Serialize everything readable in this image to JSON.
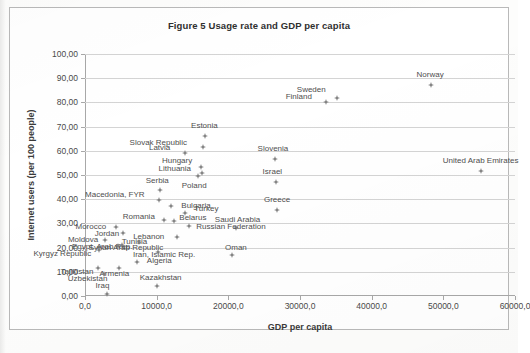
{
  "chart_data": {
    "type": "scatter",
    "title": "Figure 5 Usage rate and GDP per capita",
    "xlabel": "GDP per capita",
    "ylabel": "Internet users (per 100 people)",
    "xlim": [
      0,
      60000
    ],
    "ylim": [
      0,
      100
    ],
    "xticks": [
      0,
      10000,
      20000,
      30000,
      40000,
      50000,
      60000
    ],
    "yticks": [
      0,
      10,
      20,
      30,
      40,
      50,
      60,
      70,
      80,
      90,
      100
    ],
    "xtick_labels": [
      "0,0",
      "10000,0",
      "20000,0",
      "30000,0",
      "40000,0",
      "50000,0",
      "60000,0"
    ],
    "ytick_labels": [
      "0,00",
      "10,00",
      "20,00",
      "30,00",
      "40,00",
      "50,00",
      "60,00",
      "70,00",
      "80,00",
      "90,00",
      "100,00"
    ],
    "grid": true,
    "legend": false,
    "marker_color": "#7d7d7d",
    "points": [
      {
        "label": "Norway",
        "x": 48300,
        "y": 87.0,
        "lx": -1,
        "ly": -11
      },
      {
        "label": "Sweden",
        "x": 35200,
        "y": 82.0,
        "lx": -26,
        "ly": -9
      },
      {
        "label": "Finland",
        "x": 33600,
        "y": 80.0,
        "lx": -27,
        "ly": -6
      },
      {
        "label": "Estonia",
        "x": 16800,
        "y": 66.0,
        "lx": -1,
        "ly": -11
      },
      {
        "label": "Slovak Republic",
        "x": 16500,
        "y": 61.5,
        "lx": -45,
        "ly": -5
      },
      {
        "label": "Latvia",
        "x": 13900,
        "y": 59.0,
        "lx": -25,
        "ly": -6
      },
      {
        "label": "Hungary",
        "x": 16200,
        "y": 53.5,
        "lx": -24,
        "ly": -7
      },
      {
        "label": "Lithuania",
        "x": 16300,
        "y": 51.0,
        "lx": -27,
        "ly": -5
      },
      {
        "label": "Poland",
        "x": 15800,
        "y": 49.5,
        "lx": -4,
        "ly": 9
      },
      {
        "label": "Serbia",
        "x": 10500,
        "y": 44.0,
        "lx": -3,
        "ly": -10
      },
      {
        "label": "Slovenia",
        "x": 26500,
        "y": 56.5,
        "lx": -2,
        "ly": -11
      },
      {
        "label": "Israel",
        "x": 26700,
        "y": 47.0,
        "lx": -4,
        "ly": -11
      },
      {
        "label": "Greece",
        "x": 26800,
        "y": 35.5,
        "lx": 0,
        "ly": -11
      },
      {
        "label": "United Arab Emirates",
        "x": 55200,
        "y": 51.8,
        "lx": 0,
        "ly": -11
      },
      {
        "label": "Macedonia, FYR",
        "x": 10300,
        "y": 39.5,
        "lx": -44,
        "ly": -6
      },
      {
        "label": "Bulgaria",
        "x": 12000,
        "y": 37.0,
        "lx": 25,
        "ly": -1
      },
      {
        "label": "Turkey",
        "x": 14000,
        "y": 34.5,
        "lx": 21,
        "ly": -5
      },
      {
        "label": "Romania",
        "x": 11000,
        "y": 31.5,
        "lx": -25,
        "ly": -4
      },
      {
        "label": "Belarus",
        "x": 12400,
        "y": 31.0,
        "lx": 19,
        "ly": -4
      },
      {
        "label": "Saudi Arabia",
        "x": 21000,
        "y": 28.0,
        "lx": 2,
        "ly": -9
      },
      {
        "label": "Russian Federation",
        "x": 14500,
        "y": 29.0,
        "lx": 42,
        "ly": 0
      },
      {
        "label": "Morocco",
        "x": 4300,
        "y": 28.5,
        "lx": -25,
        "ly": -1
      },
      {
        "label": "Jordan",
        "x": 5300,
        "y": 26.0,
        "lx": -16,
        "ly": 0
      },
      {
        "label": "Lebanon",
        "x": 12800,
        "y": 24.5,
        "lx": -28,
        "ly": -1
      },
      {
        "label": "Moldova",
        "x": 2800,
        "y": 23.0,
        "lx": -22,
        "ly": -1
      },
      {
        "label": "Tunisia",
        "x": 7600,
        "y": 22.5,
        "lx": -5,
        "ly": -1
      },
      {
        "label": "Egypt, Arab Rep.",
        "x": 5200,
        "y": 21.0,
        "lx": -20,
        "ly": 1
      },
      {
        "label": "Syrian Arab Republic",
        "x": 4600,
        "y": 20.5,
        "lx": 8,
        "ly": 1
      },
      {
        "label": "Kyrgyz Republic",
        "x": 2000,
        "y": 19.0,
        "lx": -37,
        "ly": 3
      },
      {
        "label": "Iran, Islamic Rep.",
        "x": 10200,
        "y": 18.0,
        "lx": 6,
        "ly": 2
      },
      {
        "label": "Oman",
        "x": 20500,
        "y": 17.0,
        "lx": 4,
        "ly": -8
      },
      {
        "label": "Algeria",
        "x": 7300,
        "y": 14.0,
        "lx": 22,
        "ly": -2
      },
      {
        "label": "Tajikistan",
        "x": 1800,
        "y": 11.5,
        "lx": -21,
        "ly": 3
      },
      {
        "label": "Armenia",
        "x": 4800,
        "y": 11.5,
        "lx": -5,
        "ly": 5
      },
      {
        "label": "Uzbekistan",
        "x": 2600,
        "y": 9.0,
        "lx": -16,
        "ly": 4
      },
      {
        "label": "Kazakhstan",
        "x": 10000,
        "y": 4.0,
        "lx": 4,
        "ly": -9
      },
      {
        "label": "Iraq",
        "x": 3000,
        "y": 1.0,
        "lx": -4,
        "ly": -9
      }
    ]
  }
}
